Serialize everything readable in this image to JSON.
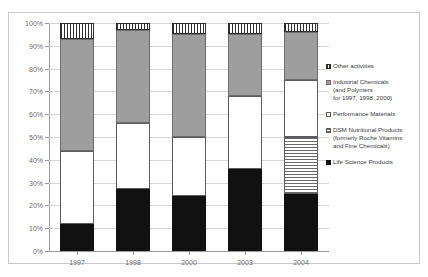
{
  "top_caption": "",
  "chart_data": {
    "type": "bar",
    "subtype": "stacked-100-percent",
    "title": "",
    "xlabel": "",
    "ylabel": "",
    "ylim": [
      0,
      100
    ],
    "ytick_labels": [
      "0%",
      "10%",
      "20%",
      "30%",
      "40%",
      "50%",
      "60%",
      "70%",
      "80%",
      "90%",
      "100%"
    ],
    "ytick_values": [
      0,
      10,
      20,
      30,
      40,
      50,
      60,
      70,
      80,
      90,
      100
    ],
    "grid": true,
    "legend_position": "right",
    "categories": [
      "1997",
      "1998",
      "2000",
      "2003",
      "2004"
    ],
    "series": [
      {
        "name": "Life Science Products",
        "pattern": "black",
        "values": [
          12,
          27,
          24,
          36,
          25
        ]
      },
      {
        "name": "DSM Nutritional Products (formerly Roche Vitamins and Fine Chemicals)",
        "pattern": "hstripe",
        "values": [
          0,
          0,
          0,
          0,
          25
        ]
      },
      {
        "name": "Performance Materials",
        "pattern": "white",
        "values": [
          32,
          29,
          26,
          32,
          25
        ]
      },
      {
        "name": "Industrial Chemicals (and Polymers for 1997, 1998, 2000)",
        "pattern": "gray",
        "values": [
          49,
          41,
          45,
          27,
          21
        ]
      },
      {
        "name": "Other activities",
        "pattern": "vstripe",
        "values": [
          7,
          3,
          5,
          5,
          4
        ]
      }
    ],
    "legend_entries": [
      {
        "label": "Other activities",
        "pattern": "vstripe"
      },
      {
        "label": "Industrial Chemicals\n(and Polymers\nfor 1997, 1998, 2000)",
        "pattern": "gray"
      },
      {
        "label": "Performance Materials",
        "pattern": "white"
      },
      {
        "label": "DSM Nutritional Products\n(formerly Roche Vitamins\nand Fine Chemicals)",
        "pattern": "hstripe"
      },
      {
        "label": "Life Science Products",
        "pattern": "black"
      }
    ]
  }
}
